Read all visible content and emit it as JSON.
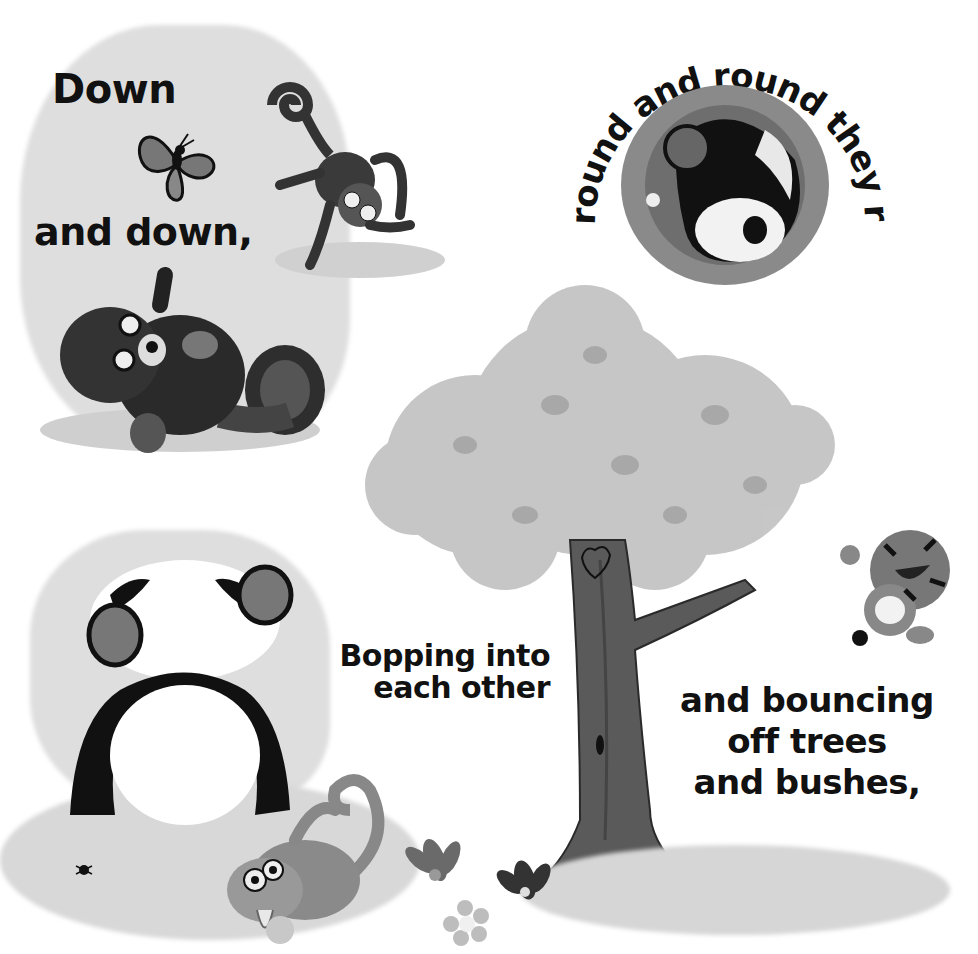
{
  "page": {
    "captions": {
      "down": "Down",
      "and_down": "and down,",
      "round_and_round": "round and round they roll.",
      "bopping_line1": "Bopping into",
      "bopping_line2": "each other",
      "bouncing_line1": "and bouncing",
      "bouncing_line2": "off trees",
      "bouncing_line3": "and bushes,"
    },
    "illustrations": [
      "butterfly",
      "monkey-upside-down",
      "red-panda-rolling",
      "panda-rolling-in-circle",
      "bee",
      "tree-with-heart-carving",
      "tiger-cub-leaping",
      "panda-rolling-front",
      "monkey-with-banana",
      "flowers",
      "spider"
    ],
    "colors": {
      "background": "#ffffff",
      "wash": "#dedede",
      "text": "#111111"
    }
  }
}
